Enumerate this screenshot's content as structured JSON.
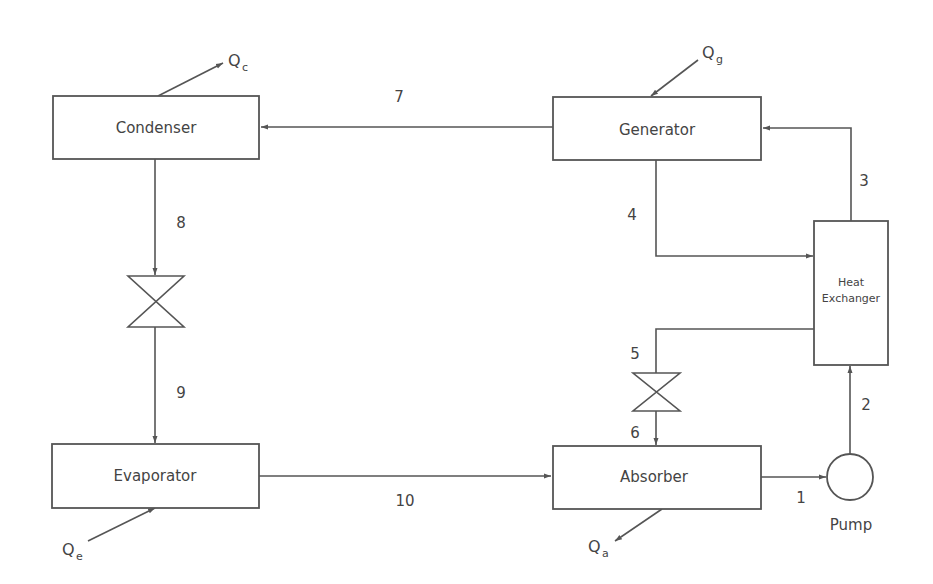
{
  "diagram": {
    "type": "absorption-refrigeration-cycle",
    "components": {
      "condenser": "Condenser",
      "generator": "Generator",
      "evaporator": "Evaporator",
      "absorber": "Absorber",
      "heat_exchanger_line1": "Heat",
      "heat_exchanger_line2": "Exchanger",
      "pump": "Pump"
    },
    "heat_flows": {
      "condenser": {
        "symbol": "Q",
        "sub": "c"
      },
      "generator": {
        "symbol": "Q",
        "sub": "g"
      },
      "evaporator": {
        "symbol": "Q",
        "sub": "e"
      },
      "absorber": {
        "symbol": "Q",
        "sub": "a"
      }
    },
    "state_points": {
      "p1": "1",
      "p2": "2",
      "p3": "3",
      "p4": "4",
      "p5": "5",
      "p6": "6",
      "p7": "7",
      "p8": "8",
      "p9": "9",
      "p10": "10"
    },
    "colors": {
      "line": "#555555",
      "text": "#444444",
      "background": "#ffffff"
    }
  }
}
